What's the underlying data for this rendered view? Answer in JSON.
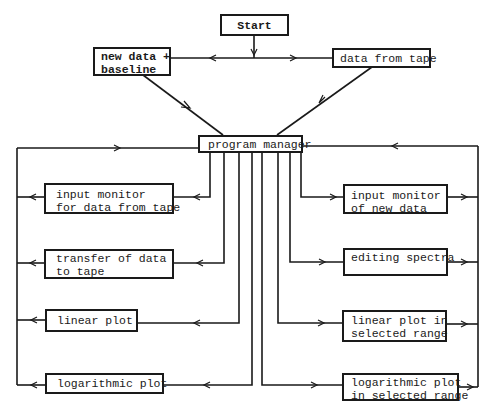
{
  "diagram": {
    "type": "flowchart",
    "nodes": {
      "start": {
        "label": "Start"
      },
      "new_data": {
        "label": "new data +\nbaseline"
      },
      "data_from_tape": {
        "label": "data from tape"
      },
      "program_manager": {
        "label": "program manager"
      },
      "left": [
        {
          "id": "input_monitor_tape",
          "label": "input monitor\nfor data from tape"
        },
        {
          "id": "transfer_to_tape",
          "label": "transfer of data\nto tape"
        },
        {
          "id": "linear_plot",
          "label": "linear plot"
        },
        {
          "id": "log_plot",
          "label": "logarithmic plot"
        }
      ],
      "right": [
        {
          "id": "input_monitor_new",
          "label": "input monitor\nof new data"
        },
        {
          "id": "editing_spectra",
          "label": "editing spectra"
        },
        {
          "id": "linear_plot_range",
          "label": "linear plot in\nselected range"
        },
        {
          "id": "log_plot_range",
          "label": "logarithmic plot\nin selected range"
        }
      ]
    },
    "edges": [
      {
        "from": "start",
        "to": "new_data"
      },
      {
        "from": "start",
        "to": "data_from_tape"
      },
      {
        "from": "new_data",
        "to": "program_manager"
      },
      {
        "from": "data_from_tape",
        "to": "program_manager"
      },
      {
        "from": "program_manager",
        "to": "input_monitor_tape"
      },
      {
        "from": "program_manager",
        "to": "transfer_to_tape"
      },
      {
        "from": "program_manager",
        "to": "linear_plot"
      },
      {
        "from": "program_manager",
        "to": "log_plot"
      },
      {
        "from": "program_manager",
        "to": "input_monitor_new"
      },
      {
        "from": "program_manager",
        "to": "editing_spectra"
      },
      {
        "from": "program_manager",
        "to": "linear_plot_range"
      },
      {
        "from": "program_manager",
        "to": "log_plot_range"
      },
      {
        "from": "left_modules",
        "to": "program_manager",
        "note": "return loop"
      },
      {
        "from": "right_modules",
        "to": "program_manager",
        "note": "return loop"
      }
    ]
  }
}
